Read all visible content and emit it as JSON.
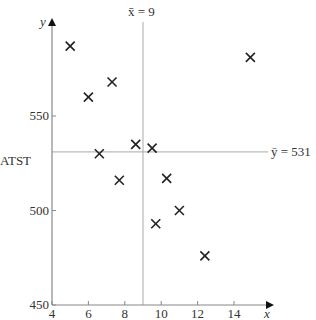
{
  "chart_data": {
    "type": "scatter",
    "title": "",
    "xlabel": "x",
    "ylabel": "y",
    "y_variable_name": "ATST",
    "xlim": [
      4,
      15.5
    ],
    "ylim": [
      450,
      600
    ],
    "x_ticks": [
      4,
      6,
      8,
      10,
      12,
      14
    ],
    "y_ticks": [
      450,
      500,
      550
    ],
    "grid": false,
    "marker": "x",
    "points": [
      {
        "x": 5.0,
        "y": 587
      },
      {
        "x": 6.0,
        "y": 560
      },
      {
        "x": 7.3,
        "y": 568
      },
      {
        "x": 6.6,
        "y": 530
      },
      {
        "x": 8.6,
        "y": 535
      },
      {
        "x": 9.5,
        "y": 533
      },
      {
        "x": 7.7,
        "y": 516
      },
      {
        "x": 10.3,
        "y": 517
      },
      {
        "x": 11.0,
        "y": 500
      },
      {
        "x": 9.7,
        "y": 493
      },
      {
        "x": 12.4,
        "y": 476
      },
      {
        "x": 14.9,
        "y": 581
      }
    ],
    "reference_lines": [
      {
        "orientation": "vertical",
        "value": 9,
        "label": "x̄ = 9"
      },
      {
        "orientation": "horizontal",
        "value": 531,
        "label": "ȳ = 531"
      }
    ]
  },
  "labels": {
    "x_axis": "x",
    "y_axis": "y",
    "y_name": "ATST",
    "xbar": "x̄ = 9",
    "ybar": "ȳ = 531"
  },
  "colors": {
    "axis": "#888888",
    "marker": "#222222",
    "refline": "#aaaaaa",
    "text": "#333333"
  }
}
